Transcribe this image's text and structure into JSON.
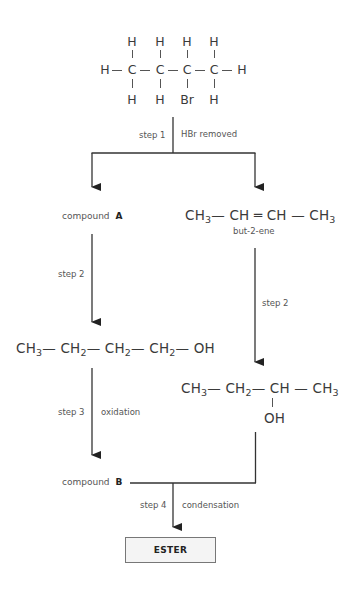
{
  "starting_molecule": {
    "name": "2-bromobutane (displayed formula)",
    "top_row": [
      "H",
      "H",
      "H",
      "H"
    ],
    "middle_row": [
      "H",
      "C",
      "C",
      "C",
      "C",
      "H"
    ],
    "bottom_row": [
      "H",
      "H",
      "Br",
      "H"
    ]
  },
  "step1": {
    "step_label": "step 1",
    "condition_label": "HBr removed"
  },
  "left_branch": {
    "compound_a_prefix": "compound",
    "compound_a_letter": "A",
    "step2_label": "step 2",
    "butanol": {
      "parts": [
        "CH",
        "3",
        "— CH",
        "2",
        "— CH",
        "2",
        "— CH",
        "2",
        "— OH"
      ]
    },
    "step3_label": "step 3",
    "step3_condition": "oxidation",
    "compound_b_prefix": "compound",
    "compound_b_letter": "B"
  },
  "right_branch": {
    "butene": {
      "parts": [
        "CH",
        "3",
        "— CH ═ CH — CH",
        "3"
      ],
      "name": "but-2-ene"
    },
    "step2_label": "step 2",
    "butan2ol": {
      "main_parts": [
        "CH",
        "3",
        "— CH",
        "2",
        "— CH — CH",
        "3"
      ],
      "substituent": "OH"
    }
  },
  "step4": {
    "step_label": "step 4",
    "condition_label": "condensation"
  },
  "product": {
    "label": "ESTER"
  },
  "colors": {
    "line": "#333333",
    "text": "#3a3a3a",
    "box_fill": "#f4f4f4",
    "box_border": "#777777"
  }
}
